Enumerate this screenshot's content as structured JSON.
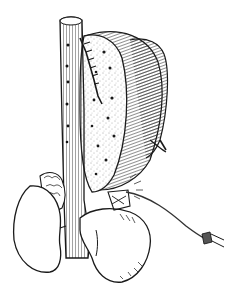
{
  "image": {
    "kind": "anatomical line illustration",
    "style": "black ink engraving on white",
    "background": "#ffffff",
    "ink": "#1a1a1a"
  },
  "elements": {
    "vessel": "vertical tubular vessel with hatched shading and dark dots",
    "organ": "large lobed organ with stippled cut surface and dark dots",
    "incision": "jagged sutured cut along organ edge",
    "lobes": "two hatched lobes behind the cut surface",
    "kidney_left": "lobulated organ at lower left",
    "mass_right": "rounded mass at lower right with hatched shading",
    "catheter": "thin tube running to lower right ending in a forked clip"
  }
}
